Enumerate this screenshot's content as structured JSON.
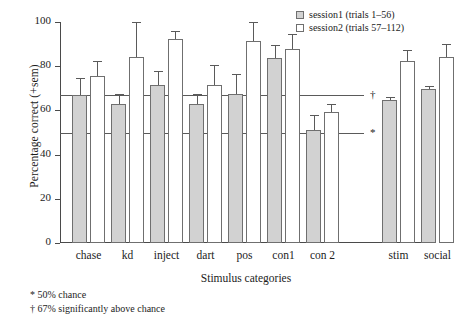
{
  "chart_data": {
    "type": "bar",
    "title": "",
    "xlabel": "Stimulus categories",
    "ylabel": "Percentage correct (+sem)",
    "ylim": [
      0,
      100
    ],
    "yticks": [
      0,
      20,
      40,
      60,
      80,
      100
    ],
    "grid": false,
    "legend_position": "top-right",
    "categories": [
      "chase",
      "kd",
      "inject",
      "dart",
      "pos",
      "con1",
      "con 2",
      "stim",
      "social"
    ],
    "group_gap_after": "con 2",
    "series": [
      {
        "name": "session1 (trials 1–56)",
        "fill": "#d2d2d2",
        "values": [
          67,
          63,
          71.5,
          63,
          67.5,
          83.5,
          51,
          64.5,
          69.5
        ],
        "sem": [
          7.5,
          4.5,
          6.5,
          4.5,
          9,
          6,
          7,
          1.5,
          1.5
        ]
      },
      {
        "name": "session2 (trials 57–112)",
        "fill": "#ffffff",
        "values": [
          75.5,
          84,
          92.5,
          71.5,
          91.5,
          88,
          59.5,
          82.5,
          84
        ],
        "sem": [
          7,
          16,
          3.5,
          9,
          8.5,
          6.5,
          3.5,
          5,
          6
        ]
      }
    ],
    "reference_lines": [
      {
        "value": 67,
        "mark": "†"
      },
      {
        "value": 50,
        "mark": "*"
      }
    ],
    "footnotes": [
      "* 50% chance",
      "† 67% significantly above chance"
    ]
  }
}
